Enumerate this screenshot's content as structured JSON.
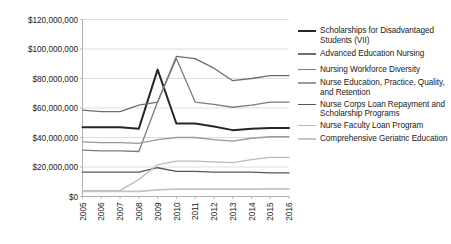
{
  "chart_data": {
    "type": "line",
    "title": "",
    "subtitle": "",
    "xlabel": "",
    "ylabel": "",
    "x": [
      "2005",
      "2006",
      "2007",
      "2008",
      "2009",
      "2010",
      "2011",
      "2012",
      "2013",
      "2014",
      "2015",
      "2016"
    ],
    "categories": [
      "2005",
      "2006",
      "2007",
      "2008",
      "2009",
      "2010",
      "2011",
      "2012",
      "2013",
      "2014",
      "2015",
      "2016"
    ],
    "ylim": [
      0,
      120000000
    ],
    "yticks": [
      0,
      20000000,
      40000000,
      60000000,
      80000000,
      100000000,
      120000000
    ],
    "ytick_labels": [
      "$0",
      "$20,000,000",
      "$40,000,000",
      "$60,000,000",
      "$80,000,000",
      "$100,000,000",
      "$120,000,000"
    ],
    "grid": true,
    "grid_axis": "y",
    "legend_position": "right",
    "series": [
      {
        "name": "Scholarships for Disadvantaged Students (VII)",
        "color": "#262626",
        "width": 2.0,
        "values": [
          47000000,
          47000000,
          47000000,
          46000000,
          86000000,
          49500000,
          49500000,
          47500000,
          45000000,
          46000000,
          46500000,
          46500000
        ]
      },
      {
        "name": "Advanced Education Nursing",
        "color": "#6e6e6e",
        "width": 1.3,
        "values": [
          58500000,
          57500000,
          57500000,
          62000000,
          64000000,
          95000000,
          93500000,
          87000000,
          78500000,
          80000000,
          82000000,
          82000000
        ]
      },
      {
        "name": "Nursing Workforce Diversity",
        "color": "#7d7d7d",
        "width": 1.3,
        "values": [
          31500000,
          31000000,
          31000000,
          30500000,
          64000000,
          93500000,
          64000000,
          62500000,
          60500000,
          62000000,
          64000000,
          64000000
        ]
      },
      {
        "name": "Nurse Education, Practice, Quality, and Retention",
        "color": "#9a9a9a",
        "width": 1.3,
        "values": [
          37000000,
          36500000,
          36500000,
          36000000,
          38500000,
          40000000,
          40000000,
          38500000,
          37500000,
          39500000,
          40500000,
          40500000
        ]
      },
      {
        "name": "Nurse Corps Loan Repayment and Scholarship Programs",
        "color": "#585858",
        "width": 1.3,
        "values": [
          16500000,
          16500000,
          16500000,
          16500000,
          19500000,
          17000000,
          17000000,
          16500000,
          16500000,
          16500000,
          16000000,
          16000000
        ]
      },
      {
        "name": "Nurse Faculty Loan Program",
        "color": "#b9b9b9",
        "width": 1.3,
        "values": [
          4000000,
          4000000,
          4000000,
          11500000,
          21500000,
          24000000,
          24000000,
          23500000,
          23000000,
          25000000,
          26500000,
          26500000
        ]
      },
      {
        "name": "Comprehensive Geriatric Education",
        "color": "#c4c4c4",
        "width": 1.8,
        "values": [
          3500000,
          3500000,
          3500000,
          3500000,
          4500000,
          5000000,
          5000000,
          5000000,
          5000000,
          5000000,
          5200000,
          5200000
        ]
      }
    ]
  },
  "legend": {
    "items": [
      {
        "label": "Scholarships for Disadvantaged Students (VII)"
      },
      {
        "label": "Advanced Education Nursing"
      },
      {
        "label": "Nursing Workforce Diversity"
      },
      {
        "label": "Nurse Education, Practice, Quality, and Retention"
      },
      {
        "label": "Nurse Corps Loan Repayment and Scholarship Programs"
      },
      {
        "label": "Nurse Faculty Loan Program"
      },
      {
        "label": "Comprehensive Geriatric Education"
      }
    ]
  }
}
